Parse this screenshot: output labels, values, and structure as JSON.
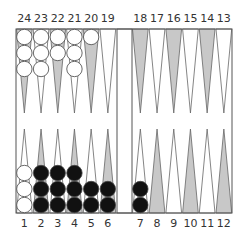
{
  "board": {
    "colors": {
      "frame": "#555555",
      "shaded_point": "#c8c8c8",
      "plain_point": "#ffffff",
      "white_checker": "#ffffff",
      "black_checker": "#111111"
    },
    "top_labels": [
      "24",
      "23",
      "22",
      "21",
      "20",
      "19",
      "18",
      "17",
      "16",
      "15",
      "14",
      "13"
    ],
    "bottom_labels": [
      "1",
      "2",
      "3",
      "4",
      "5",
      "6",
      "7",
      "8",
      "9",
      "10",
      "11",
      "12"
    ],
    "points": [
      {
        "num": 1,
        "shaded": false,
        "color": "white",
        "count": 3
      },
      {
        "num": 2,
        "shaded": true,
        "color": "black",
        "count": 3
      },
      {
        "num": 3,
        "shaded": false,
        "color": "black",
        "count": 3
      },
      {
        "num": 4,
        "shaded": true,
        "color": "black",
        "count": 3
      },
      {
        "num": 5,
        "shaded": false,
        "color": "black",
        "count": 2
      },
      {
        "num": 6,
        "shaded": true,
        "color": "black",
        "count": 2
      },
      {
        "num": 7,
        "shaded": false,
        "color": "black",
        "count": 2
      },
      {
        "num": 8,
        "shaded": true,
        "color": null,
        "count": 0
      },
      {
        "num": 9,
        "shaded": false,
        "color": null,
        "count": 0
      },
      {
        "num": 10,
        "shaded": true,
        "color": null,
        "count": 0
      },
      {
        "num": 11,
        "shaded": false,
        "color": null,
        "count": 0
      },
      {
        "num": 12,
        "shaded": true,
        "color": null,
        "count": 0
      },
      {
        "num": 13,
        "shaded": false,
        "color": null,
        "count": 0
      },
      {
        "num": 14,
        "shaded": true,
        "color": null,
        "count": 0
      },
      {
        "num": 15,
        "shaded": false,
        "color": null,
        "count": 0
      },
      {
        "num": 16,
        "shaded": true,
        "color": null,
        "count": 0
      },
      {
        "num": 17,
        "shaded": false,
        "color": null,
        "count": 0
      },
      {
        "num": 18,
        "shaded": true,
        "color": null,
        "count": 0
      },
      {
        "num": 19,
        "shaded": false,
        "color": null,
        "count": 0
      },
      {
        "num": 20,
        "shaded": true,
        "color": "white",
        "count": 1
      },
      {
        "num": 21,
        "shaded": false,
        "color": "white",
        "count": 3
      },
      {
        "num": 22,
        "shaded": true,
        "color": "white",
        "count": 2
      },
      {
        "num": 23,
        "shaded": false,
        "color": "white",
        "count": 3
      },
      {
        "num": 24,
        "shaded": true,
        "color": "white",
        "count": 3
      }
    ]
  }
}
